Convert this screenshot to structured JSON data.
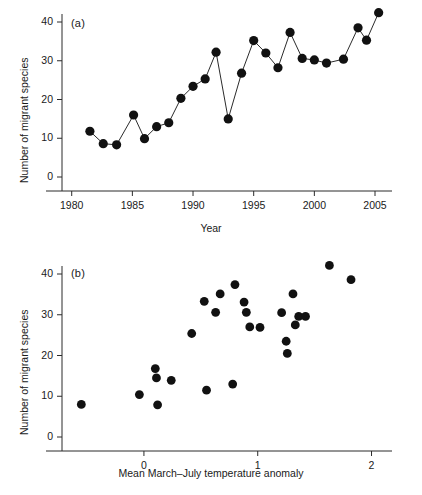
{
  "figure": {
    "panel_a_label": "(a)",
    "panel_b_label": "(b)"
  },
  "chart_data": [
    {
      "type": "line",
      "panel": "(a)",
      "title": "",
      "xlabel": "Year",
      "ylabel": "Number of migrant species",
      "xlim": [
        1979.2,
        2006.4
      ],
      "ylim": [
        0,
        44
      ],
      "xticks": [
        1980,
        1985,
        1990,
        1995,
        2000,
        2005
      ],
      "xticklabels": [
        "1980",
        "1985",
        "1990",
        "1995",
        "2000",
        "2005"
      ],
      "yticks": [
        0,
        10,
        20,
        30,
        40
      ],
      "yticklabels": [
        "0",
        "10",
        "20",
        "30",
        "40"
      ],
      "grid": false,
      "legend": "none",
      "markers": "filled-circle",
      "x": [
        1981.5,
        1982.6,
        1983.7,
        1985.1,
        1986.0,
        1987.0,
        1988.0,
        1989.0,
        1990.0,
        1991.0,
        1991.9,
        1992.9,
        1994.0,
        1995.0,
        1996.0,
        1997.0,
        1998.0,
        1999.0,
        2000.0,
        2001.0,
        2002.4,
        2003.6,
        2004.3,
        2005.3
      ],
      "values": [
        11.8,
        8.6,
        8.3,
        16.0,
        9.9,
        13.0,
        14.0,
        20.3,
        23.4,
        25.3,
        32.2,
        15.0,
        26.8,
        35.2,
        32.0,
        28.2,
        37.3,
        30.6,
        30.2,
        29.4,
        30.4,
        38.5,
        35.3,
        42.4
      ]
    },
    {
      "type": "scatter",
      "panel": "(b)",
      "title": "",
      "xlabel": "Mean March–July temperature anomaly",
      "ylabel": "Number of migrant species",
      "xlim": [
        -0.72,
        2.18
      ],
      "ylim": [
        0,
        44
      ],
      "xticks": [
        0,
        1,
        2
      ],
      "xticklabels": [
        "0",
        "1",
        "2"
      ],
      "yticks": [
        0,
        10,
        20,
        30,
        40
      ],
      "yticklabels": [
        "0",
        "10",
        "20",
        "30",
        "40"
      ],
      "grid": false,
      "legend": "none",
      "markers": "filled-circle",
      "x": [
        -0.55,
        -0.04,
        0.1,
        0.11,
        0.12,
        0.24,
        0.42,
        0.53,
        0.55,
        0.63,
        0.67,
        0.78,
        0.8,
        0.88,
        0.9,
        0.93,
        1.02,
        1.21,
        1.25,
        1.26,
        1.31,
        1.33,
        1.36,
        1.42,
        1.63,
        1.82
      ],
      "values": [
        8.0,
        10.4,
        16.8,
        14.5,
        7.9,
        13.9,
        25.4,
        33.3,
        11.5,
        30.6,
        35.1,
        13.0,
        37.4,
        33.1,
        30.6,
        27.0,
        26.9,
        30.5,
        23.5,
        20.5,
        35.1,
        27.5,
        29.6,
        29.6,
        42.1,
        38.6
      ]
    }
  ]
}
